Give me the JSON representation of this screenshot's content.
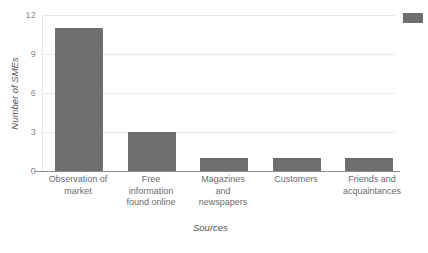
{
  "chart_data": {
    "type": "bar",
    "title": "",
    "xlabel": "Sources",
    "ylabel": "Number of SMEs",
    "categories": [
      "Observation of market",
      "Free information found online",
      "Magazines and newspapers",
      "Customers",
      "Friends and acquaintances"
    ],
    "category_lines": [
      [
        "Observation of",
        "market"
      ],
      [
        "Free",
        "information",
        "found online"
      ],
      [
        "Magazines",
        "and",
        "newspapers"
      ],
      [
        "Customers"
      ],
      [
        "Friends and",
        "acquaintances"
      ]
    ],
    "values": [
      11,
      3,
      1,
      1,
      1
    ],
    "ylim": [
      0,
      12
    ],
    "yticks": [
      0,
      3,
      6,
      9,
      12
    ],
    "ytick_labels": [
      "0",
      "3",
      "6",
      "9",
      "12"
    ],
    "grid": true,
    "legend_position": "top-right",
    "legend_label": "",
    "bar_color": "#6f6f6f",
    "gridline_color": "#e9e9e9",
    "axis_color": "#8d8d8d",
    "text_color": "#6b6b6b",
    "background": "#ffffff"
  }
}
